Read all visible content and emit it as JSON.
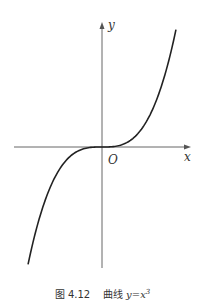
{
  "figure": {
    "number_label": "图 4.12",
    "title_label": "曲线",
    "equation_lhs": "y",
    "equation_eq": "=",
    "equation_base": "x",
    "equation_exp": "3",
    "axis_x_label": "x",
    "axis_y_label": "y",
    "origin_label": "O",
    "curve_color": "#222222",
    "axis_color": "#555555"
  },
  "chart_data": {
    "type": "line",
    "xlabel": "x",
    "ylabel": "y",
    "function": "y = x^3",
    "x": [
      -1.45,
      -1.2,
      -1.0,
      -0.8,
      -0.6,
      -0.4,
      -0.2,
      0,
      0.2,
      0.4,
      0.6,
      0.8,
      1.0,
      1.2,
      1.45
    ],
    "y": [
      -3.05,
      -1.73,
      -1.0,
      -0.51,
      -0.22,
      -0.06,
      -0.01,
      0,
      0.01,
      0.06,
      0.22,
      0.51,
      1.0,
      1.73,
      3.05
    ],
    "grid": false,
    "legend": null,
    "annotations": [
      "O"
    ]
  }
}
